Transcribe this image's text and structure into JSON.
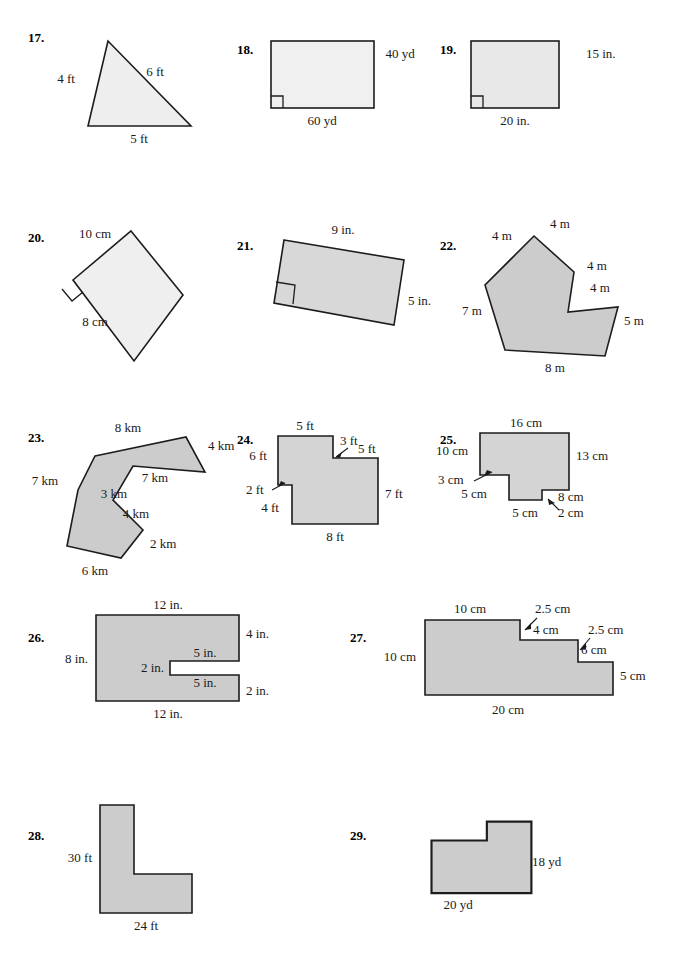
{
  "page": {
    "width": 673,
    "height": 960,
    "background": "#ffffff",
    "fill_light": "#f0f0f0",
    "fill_medium": "#cccccc",
    "stroke": "#1c1c1c",
    "text_color": "#1a1a1a"
  },
  "problems": [
    {
      "id": "17",
      "number": "17.",
      "shape": "triangle",
      "fill": "#eeeeee",
      "labels": [
        "4 ft",
        "6 ft",
        "5 ft"
      ],
      "side_lengths": [
        4,
        6,
        5
      ],
      "unit": "ft",
      "right_angle_marks": 0
    },
    {
      "id": "18",
      "number": "18.",
      "shape": "rectangle",
      "fill": "#f0f0f0",
      "labels": [
        "40 yd",
        "60 yd"
      ],
      "width_value": 60,
      "height_value": 40,
      "unit": "yd",
      "right_angle_marks": 1
    },
    {
      "id": "19",
      "number": "19.",
      "shape": "rectangle",
      "fill": "#e8e8e8",
      "labels": [
        "15 in.",
        "20 in."
      ],
      "width_value": 20,
      "height_value": 15,
      "unit": "in.",
      "right_angle_marks": 1
    },
    {
      "id": "20",
      "number": "20.",
      "shape": "rotated-rectangle",
      "fill": "#efefef",
      "labels": [
        "10 cm",
        "8 cm"
      ],
      "width_value": 10,
      "height_value": 8,
      "unit": "cm",
      "right_angle_marks": 1
    },
    {
      "id": "21",
      "number": "21.",
      "shape": "tilted-rectangle",
      "fill": "#d8d8d8",
      "labels": [
        "9 in.",
        "5 in."
      ],
      "width_value": 9,
      "height_value": 5,
      "unit": "in.",
      "right_angle_marks": 1
    },
    {
      "id": "22",
      "number": "22.",
      "shape": "concave-polygon",
      "fill": "#cccccc",
      "labels": [
        "4 m",
        "4 m",
        "4 m",
        "4 m",
        "5 m",
        "8 m",
        "7 m"
      ],
      "side_lengths": [
        4,
        4,
        4,
        4,
        5,
        8,
        7
      ],
      "unit": "m",
      "right_angle_marks": 0
    },
    {
      "id": "23",
      "number": "23.",
      "shape": "concave-polygon",
      "fill": "#cccccc",
      "labels": [
        "8 km",
        "4 km",
        "7 km",
        "3 km",
        "4 km",
        "2 km",
        "6 km",
        "7 km"
      ],
      "side_lengths": [
        8,
        4,
        7,
        3,
        4,
        2,
        6,
        7
      ],
      "unit": "km",
      "right_angle_marks": 0
    },
    {
      "id": "24",
      "number": "24.",
      "shape": "rectilinear",
      "fill": "#d4d4d4",
      "labels": [
        "5 ft",
        "3 ft",
        "5 ft",
        "6 ft",
        "2 ft",
        "4 ft",
        "7 ft",
        "8 ft"
      ],
      "side_lengths": [
        5,
        3,
        5,
        6,
        2,
        4,
        7,
        8
      ],
      "unit": "ft",
      "right_angle_marks": 0
    },
    {
      "id": "25",
      "number": "25.",
      "shape": "rectilinear",
      "fill": "#d4d4d4",
      "labels": [
        "16 cm",
        "10 cm",
        "13 cm",
        "3 cm",
        "5 cm",
        "5 cm",
        "2 cm",
        "8 cm"
      ],
      "side_lengths": [
        16,
        10,
        13,
        3,
        5,
        5,
        2,
        8
      ],
      "unit": "cm",
      "right_angle_marks": 0
    },
    {
      "id": "26",
      "number": "26.",
      "shape": "rectilinear-notch",
      "fill": "#cccccc",
      "labels": [
        "12 in.",
        "4 in.",
        "5 in.",
        "2 in.",
        "5 in.",
        "2 in.",
        "12 in.",
        "8 in."
      ],
      "side_lengths": [
        12,
        4,
        5,
        2,
        5,
        2,
        12,
        8
      ],
      "unit": "in.",
      "right_angle_marks": 0
    },
    {
      "id": "27",
      "number": "27.",
      "shape": "staircase",
      "fill": "#cccccc",
      "labels": [
        "10 cm",
        "2.5 cm",
        "4 cm",
        "2.5 cm",
        "6 cm",
        "5 cm",
        "20 cm",
        "10 cm"
      ],
      "side_lengths": [
        10,
        2.5,
        4,
        2.5,
        6,
        5,
        20,
        10
      ],
      "unit": "cm",
      "right_angle_marks": 0
    },
    {
      "id": "28",
      "number": "28.",
      "shape": "L-shape",
      "fill": "#cccccc",
      "labels": [
        "30 ft",
        "24 ft"
      ],
      "side_lengths": [
        30,
        24
      ],
      "unit": "ft",
      "right_angle_marks": 0
    },
    {
      "id": "29",
      "number": "29.",
      "shape": "L-shape-mirrored",
      "fill": "#cccccc",
      "labels": [
        "18 yd",
        "20 yd"
      ],
      "side_lengths": [
        18,
        20
      ],
      "unit": "yd",
      "right_angle_marks": 0
    }
  ]
}
